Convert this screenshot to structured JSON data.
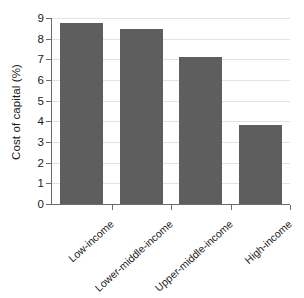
{
  "chart_data": {
    "type": "bar",
    "title": "",
    "xlabel": "",
    "ylabel": "Cost of capital (%)",
    "categories": [
      "Low-income",
      "Lower-middle-income",
      "Upper-middle-income",
      "High-income"
    ],
    "values": [
      8.75,
      8.45,
      7.1,
      3.8
    ],
    "ylim": [
      0,
      9
    ],
    "yticks": [
      "0",
      "1",
      "2",
      "3",
      "4",
      "5",
      "6",
      "7",
      "8",
      "9"
    ],
    "ytick_values": [
      0,
      1,
      2,
      3,
      4,
      5,
      6,
      7,
      8,
      9
    ],
    "grid": true,
    "legend": "none",
    "bar_color": "#5e5e5e",
    "grid_color": "#e3e3e3",
    "axis_color": "#6b6b6b",
    "background": "#ffffff",
    "xtick_label_rotation": -42
  }
}
